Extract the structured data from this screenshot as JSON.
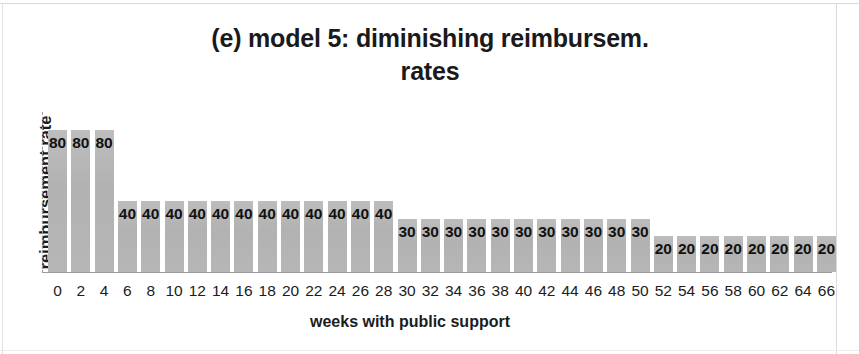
{
  "chart_data": {
    "type": "bar",
    "title": "(e) model 5: diminishing reimbursem. rates",
    "title_line1": "(e) model 5: diminishing reimbursem.",
    "title_line2": "rates",
    "xlabel": "weeks with public support",
    "ylabel": "reimbursement rate",
    "grid": false,
    "legend": "none",
    "ylim": [
      0,
      90
    ],
    "xlim": [
      -1,
      67
    ],
    "bar_color": "#b4b4b4",
    "axis_color": "#9b9b9b",
    "categories": [
      0,
      2,
      4,
      6,
      8,
      10,
      12,
      14,
      16,
      18,
      20,
      22,
      24,
      26,
      28,
      30,
      32,
      34,
      36,
      38,
      40,
      42,
      44,
      46,
      48,
      50,
      52,
      54,
      56,
      58,
      60,
      62,
      64,
      66
    ],
    "values": [
      80,
      80,
      80,
      40,
      40,
      40,
      40,
      40,
      40,
      40,
      40,
      40,
      40,
      40,
      40,
      30,
      30,
      30,
      30,
      30,
      30,
      30,
      30,
      30,
      30,
      30,
      20,
      20,
      20,
      20,
      20,
      20,
      20,
      20
    ],
    "tick_labels": [
      "0",
      "2",
      "4",
      "6",
      "8",
      "10",
      "12",
      "14",
      "16",
      "18",
      "20",
      "22",
      "24",
      "26",
      "28",
      "30",
      "32",
      "34",
      "36",
      "38",
      "40",
      "42",
      "44",
      "46",
      "48",
      "50",
      "52",
      "54",
      "56",
      "58",
      "60",
      "62",
      "64",
      "66"
    ],
    "data_labels": [
      "80",
      "80",
      "80",
      "40",
      "40",
      "40",
      "40",
      "40",
      "40",
      "40",
      "40",
      "40",
      "40",
      "40",
      "40",
      "30",
      "30",
      "30",
      "30",
      "30",
      "30",
      "30",
      "30",
      "30",
      "30",
      "30",
      "20",
      "20",
      "20",
      "20",
      "20",
      "20",
      "20",
      "20"
    ]
  }
}
